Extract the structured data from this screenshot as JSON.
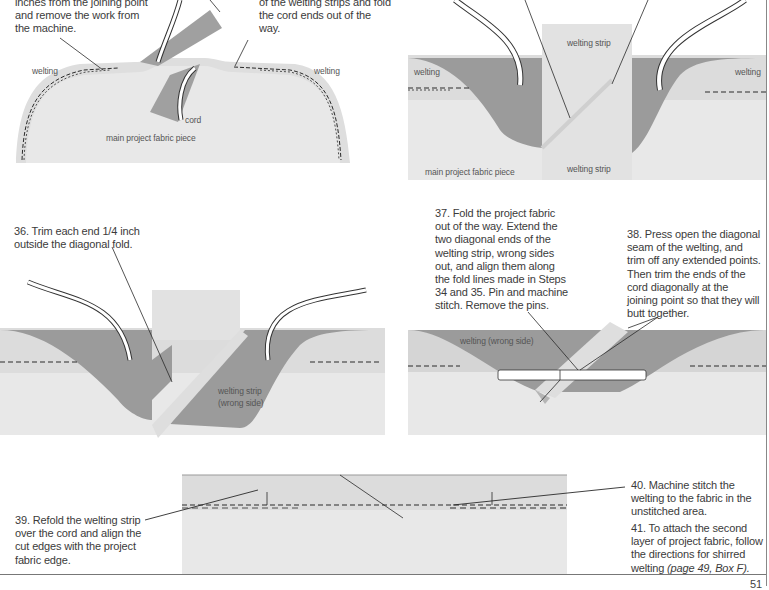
{
  "document": {
    "type": "sewing-instructions-page",
    "page_number": "51",
    "colors": {
      "fabric_light": "#e7e7e7",
      "welting_band": "#d9d9d9",
      "welting_dark": "#9b9b9b",
      "cord": "#ffffff",
      "text": "#3b3b3b",
      "stitch": "#2a2a2a"
    }
  },
  "steps": {
    "step_33_tail": {
      "lines": [
        "inches from the joining point",
        "and remove the work from",
        "the machine."
      ]
    },
    "step_34_tail": {
      "lines": [
        "of the welting strips and fold",
        "the cord ends out of the",
        "way."
      ]
    },
    "step_36": {
      "lines": [
        "36. Trim each end 1/4 inch",
        "outside the diagonal fold."
      ]
    },
    "step_37": {
      "lines": [
        "37. Fold the project fabric",
        "out of the way. Extend the",
        "two diagonal ends of the",
        "welting strip, wrong sides",
        "out, and align them along",
        "the fold lines made in Steps",
        "34 and 35. Pin and machine",
        "stitch. Remove the pins."
      ]
    },
    "step_38": {
      "lines": [
        "38. Press open the diagonal",
        "seam of the welting, and",
        "trim off any extended points.",
        "Then trim the ends of the",
        "cord diagonally at the",
        "joining point so that they will",
        "butt together."
      ]
    },
    "step_39": {
      "lines": [
        "39. Refold the welting strip",
        "over the cord and align the",
        "cut edges with the project",
        "fabric edge."
      ]
    },
    "step_40": {
      "lines": [
        "40. Machine stitch the",
        "welting to the fabric in the",
        "unstitched area."
      ]
    },
    "step_41": {
      "lines": [
        "41. To attach the second",
        "layer of project fabric, follow",
        "the directions for shirred"
      ],
      "last_line_prefix": "welting ",
      "last_line_italic": "(page 49, Box F)."
    }
  },
  "labels": {
    "panel_1": {
      "welting_left": "welting",
      "welting_right": "welting",
      "cord": "cord",
      "main_fabric": "main project fabric piece"
    },
    "panel_2": {
      "welting_left": "welting",
      "welting_right": "welting",
      "strip_top": "welting strip",
      "strip_bottom": "welting strip",
      "main_fabric": "main project fabric piece"
    },
    "panel_3": {
      "strip_line1": "welting strip",
      "strip_line2": "(wrong side)"
    },
    "panel_4": {
      "welting": "welting (wrong side)"
    }
  }
}
